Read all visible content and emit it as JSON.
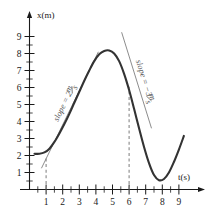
{
  "chart_data": {
    "type": "line",
    "title": "",
    "xlabel": "t(s)",
    "ylabel": "x(m)",
    "xlim": [
      0,
      9.6
    ],
    "ylim": [
      0,
      9.9
    ],
    "grid": false,
    "legend": null,
    "x_ticks_major": [
      1,
      2,
      3,
      4,
      5,
      6,
      7,
      8,
      9
    ],
    "x_tick_labels": [
      "1",
      "2",
      "3",
      "4",
      "5",
      "6",
      "7",
      "8",
      "9"
    ],
    "x_minor_step": 0.5,
    "y_ticks_major": [
      1,
      2,
      3,
      4,
      5,
      6,
      7,
      8,
      9
    ],
    "y_tick_labels": [
      "1",
      "2",
      "3",
      "4",
      "5",
      "6",
      "7",
      "8",
      "9"
    ],
    "y_minor_step": 0.5,
    "x": [
      0.3,
      0.6,
      0.9,
      1.2,
      1.5,
      1.8,
      2.1,
      2.4,
      2.7,
      3.0,
      3.3,
      3.6,
      3.9,
      4.2,
      4.5,
      4.8,
      5.1,
      5.4,
      5.7,
      6.0,
      6.3,
      6.6,
      6.9,
      7.2,
      7.5,
      7.8,
      8.1,
      8.4,
      8.7,
      9.0,
      9.3
    ],
    "values": [
      2.1,
      2.1,
      2.18,
      2.4,
      2.8,
      3.3,
      3.85,
      4.45,
      5.1,
      5.75,
      6.4,
      7.0,
      7.55,
      7.95,
      8.15,
      8.18,
      8.0,
      7.55,
      6.8,
      5.85,
      4.75,
      3.6,
      2.5,
      1.55,
      0.85,
      0.55,
      0.62,
      1.0,
      1.62,
      2.35,
      3.15
    ],
    "series": [
      {
        "name": "position",
        "color": "#333333"
      }
    ],
    "annotations": [
      {
        "name": "tangent-left",
        "label": "slope = 2",
        "label_units": "m/s",
        "slope": 2,
        "at_t": 1,
        "line_from": [
          0.72,
          1.25
        ],
        "line_to": [
          4.15,
          8.1
        ]
      },
      {
        "name": "tangent-right",
        "label": "slope = −3",
        "label_units": "m/s",
        "slope": -3,
        "at_t": 6,
        "line_from": [
          5.55,
          9.25
        ],
        "line_to": [
          7.35,
          3.6
        ]
      }
    ],
    "markers": [
      {
        "name": "dashed-line-t1",
        "t": 1,
        "from_x": 0.0,
        "to_x": 1.9
      },
      {
        "name": "dashed-line-t6",
        "t": 6,
        "from_x": 0.0,
        "to_x": 6.05
      }
    ]
  }
}
